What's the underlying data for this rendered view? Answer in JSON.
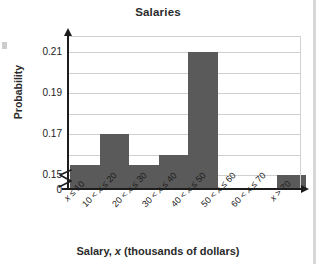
{
  "chart_data": {
    "type": "bar",
    "title": "Salaries",
    "xlabel": "Salary, x (thousands of dollars)",
    "ylabel": "Probability",
    "categories": [
      "x ≤ 10",
      "10 < x ≤ 20",
      "20 < x ≤ 30",
      "30 < x ≤ 40",
      "40 < x ≤ 50",
      "50 < x ≤ 60",
      "60 < x ≤ 70",
      "x > 70"
    ],
    "values": [
      0.155,
      0.17,
      0.155,
      0.16,
      0.21,
      0.0,
      0.0,
      0.15
    ],
    "ylim": [
      0.15,
      0.215
    ],
    "y_axis_broken": true,
    "y_break_from": 0,
    "y_break_to": 0.15,
    "ytick_labels": [
      "0",
      "0.15",
      "0.17",
      "0.19",
      "0.21"
    ],
    "ytick_values": [
      0,
      0.15,
      0.17,
      0.19,
      0.21
    ],
    "gridline_values": [
      0.15,
      0.16,
      0.17,
      0.18,
      0.19,
      0.2,
      0.21
    ],
    "grid": true,
    "legend": false,
    "bar_color": "#5a5a5a",
    "gridline_color": "#cfcfcf",
    "axis_color": "#1c1c1c"
  },
  "axis": {
    "yticks": [
      {
        "label": "0.21",
        "value": 0.21
      },
      {
        "label": "0.19",
        "value": 0.19
      },
      {
        "label": "0.17",
        "value": 0.17
      },
      {
        "label": "0.15",
        "value": 0.15
      },
      {
        "label": "0",
        "value": 0
      }
    ],
    "xticks": [
      {
        "label": "x ≤ 10"
      },
      {
        "label": "10 < x ≤ 20"
      },
      {
        "label": "20 < x ≤ 30"
      },
      {
        "label": "30 < x ≤ 40"
      },
      {
        "label": "40 < x ≤ 50"
      },
      {
        "label": "50 < x ≤ 60"
      },
      {
        "label": "60 < x ≤ 70"
      },
      {
        "label": "x > 70"
      }
    ]
  }
}
